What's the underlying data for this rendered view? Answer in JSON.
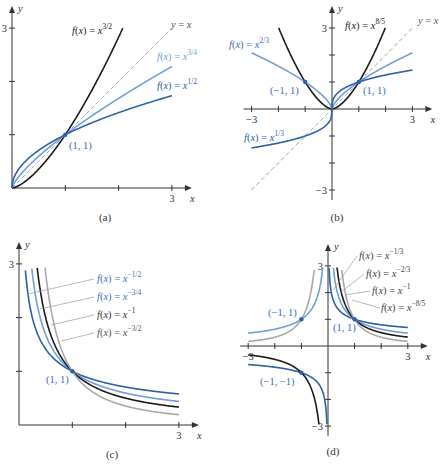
{
  "colors": {
    "black": "#1a1a1a",
    "gray": "#a8a8a8",
    "dark_blue": "#2f5fa8",
    "light_blue": "#6f9fd6",
    "dashed": "#888888",
    "text_blue": "#3b6fb8"
  },
  "chart_data": [
    {
      "type": "line",
      "panel": "(a)",
      "caption": "(a)",
      "xlabel": "x",
      "ylabel": "y",
      "xlim": [
        0,
        3
      ],
      "ylim": [
        0,
        3
      ],
      "x_ticks": [
        1,
        2,
        3
      ],
      "x_tick_labels": [
        "",
        "",
        "3"
      ],
      "y_ticks": [
        1,
        2,
        3
      ],
      "y_tick_labels": [
        "",
        "",
        "3"
      ],
      "series": [
        {
          "name": "f(x) = x^{3/2}",
          "base": "f(x) = x",
          "exp": "3/2",
          "p": 1.5,
          "color": "black",
          "domain": [
            0,
            2.1
          ]
        },
        {
          "name": "y = x",
          "p": 1,
          "color": "dashed",
          "dashed": true,
          "domain": [
            0,
            3
          ]
        },
        {
          "name": "f(x) = x^{3/4}",
          "base": "f(x) = x",
          "exp": "3/4",
          "p": 0.75,
          "color": "light_blue",
          "domain": [
            0,
            3
          ]
        },
        {
          "name": "f(x) = x^{1/2}",
          "base": "f(x) = x",
          "exp": "1/2",
          "p": 0.5,
          "color": "dark_blue",
          "domain": [
            0,
            3
          ]
        }
      ],
      "annotations": [
        {
          "text": "(1, 1)",
          "x": 1,
          "y": 1
        }
      ]
    },
    {
      "type": "line",
      "panel": "(b)",
      "caption": "(b)",
      "xlabel": "x",
      "ylabel": "y",
      "xlim": [
        -3,
        3
      ],
      "ylim": [
        -3,
        3
      ],
      "x_ticks": [
        -3,
        -2,
        -1,
        1,
        2,
        3
      ],
      "x_tick_labels": [
        "−3",
        "",
        "",
        "",
        "",
        "3"
      ],
      "y_ticks": [
        -3,
        -2,
        -1,
        1,
        2,
        3
      ],
      "y_tick_labels": [
        "−3",
        "",
        "",
        "",
        "",
        "3"
      ],
      "series": [
        {
          "name": "f(x) = x^{8/5}",
          "base": "f(x) = x",
          "exp": "8/5",
          "p": 1.6,
          "color": "black",
          "domain": [
            -2,
            2
          ]
        },
        {
          "name": "y = x",
          "p": 1,
          "color": "dashed",
          "dashed": true,
          "domain": [
            -3,
            3
          ]
        },
        {
          "name": "f(x) = x^{2/3}",
          "base": "f(x) = x",
          "exp": "2/3",
          "p": 0.6667,
          "color": "light_blue",
          "domain": [
            -3,
            3
          ]
        },
        {
          "name": "f(x) = x^{1/3}",
          "base": "f(x) = x",
          "exp": "1/3",
          "p": 0.3333,
          "color": "dark_blue",
          "domain": [
            -3,
            3
          ]
        }
      ],
      "annotations": [
        {
          "text": "(−1, 1)",
          "x": -1,
          "y": 1
        },
        {
          "text": "(1, 1)",
          "x": 1,
          "y": 1
        }
      ]
    },
    {
      "type": "line",
      "panel": "(c)",
      "caption": "(c)",
      "xlabel": "x",
      "ylabel": "y",
      "xlim": [
        0,
        3
      ],
      "ylim": [
        0,
        3
      ],
      "x_ticks": [
        1,
        2,
        3
      ],
      "x_tick_labels": [
        "",
        "",
        "3"
      ],
      "y_ticks": [
        1,
        2,
        3
      ],
      "y_tick_labels": [
        "",
        "",
        "3"
      ],
      "series": [
        {
          "name": "f(x) = x^{−1/2}",
          "base": "f(x) = x",
          "exp": "−1/2",
          "p": -0.5,
          "color": "dark_blue",
          "domain": [
            0.111,
            3
          ]
        },
        {
          "name": "f(x) = x^{−3/4}",
          "base": "f(x) = x",
          "exp": "−3/4",
          "p": -0.75,
          "color": "light_blue",
          "domain": [
            0.231,
            3
          ]
        },
        {
          "name": "f(x) = x^{−1}",
          "base": "f(x) = x",
          "exp": "−1",
          "p": -1,
          "color": "black",
          "domain": [
            0.333,
            3
          ]
        },
        {
          "name": "f(x) = x^{−3/2}",
          "base": "f(x) = x",
          "exp": "−3/2",
          "p": -1.5,
          "color": "gray",
          "domain": [
            0.48,
            3
          ]
        }
      ],
      "annotations": [
        {
          "text": "(1, 1)",
          "x": 1,
          "y": 1
        }
      ]
    },
    {
      "type": "line",
      "panel": "(d)",
      "caption": "(d)",
      "xlabel": "x",
      "ylabel": "y",
      "xlim": [
        -3,
        3
      ],
      "ylim": [
        -3,
        3
      ],
      "x_ticks": [
        -3,
        -2,
        -1,
        1,
        2,
        3
      ],
      "x_tick_labels": [
        "−3",
        "",
        "",
        "",
        "",
        "3"
      ],
      "y_ticks": [
        -3,
        -2,
        -1,
        1,
        2,
        3
      ],
      "y_tick_labels": [
        "−3",
        "",
        "",
        "",
        "",
        "3"
      ],
      "series": [
        {
          "name": "f(x) = x^{−1/3}",
          "base": "f(x) = x",
          "exp": "−1/3",
          "p": -0.3333,
          "color": "dark_blue",
          "domain": [
            -3,
            3
          ]
        },
        {
          "name": "f(x) = x^{−2/3}",
          "base": "f(x) = x",
          "exp": "−2/3",
          "p": -0.6667,
          "color": "light_blue",
          "domain": [
            -3,
            3
          ]
        },
        {
          "name": "f(x) = x^{−1}",
          "base": "f(x) = x",
          "exp": "−1",
          "p": -1,
          "color": "black",
          "domain": [
            -3,
            3
          ]
        },
        {
          "name": "f(x) = x^{−8/5}",
          "base": "f(x) = x",
          "exp": "−8/5",
          "p": -1.6,
          "color": "gray",
          "domain": [
            -3,
            3
          ]
        }
      ],
      "annotations": [
        {
          "text": "(−1, 1)",
          "x": -1,
          "y": 1
        },
        {
          "text": "(1, 1)",
          "x": 1,
          "y": 1
        },
        {
          "text": "(−1, −1)",
          "x": -1,
          "y": -1
        }
      ]
    }
  ],
  "labels": {
    "x": "x",
    "y": "y",
    "yx": "y = x",
    "fx": "f(x) = x"
  }
}
